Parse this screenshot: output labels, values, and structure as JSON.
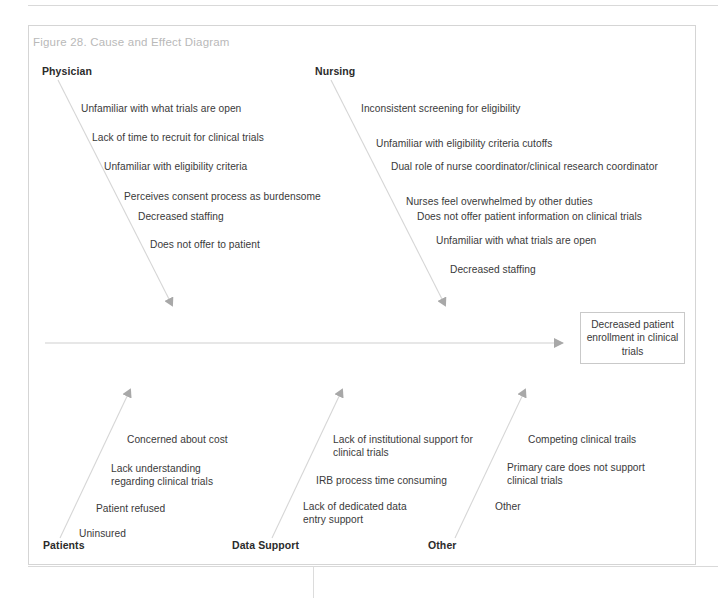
{
  "figure": {
    "title": "Figure 28. Cause and Effect Diagram",
    "type": "fishbone-cause-and-effect-diagram"
  },
  "effect": {
    "text": "Decreased patient enrollment in clinical trials"
  },
  "branches": {
    "physician": {
      "label": "Physician",
      "causes": [
        "Unfamiliar with what trials are open",
        "Lack of time to recruit for clinical trials",
        "Unfamiliar with eligibility criteria",
        "Perceives consent process as burdensome",
        "Decreased staffing",
        "Does not offer to patient"
      ]
    },
    "nursing": {
      "label": "Nursing",
      "causes": [
        "Inconsistent screening for eligibility",
        "Unfamiliar with eligibility criteria cutoffs",
        "Dual role of nurse coordinator/clinical research coordinator",
        "Nurses feel overwhelmed by other duties",
        "Does not offer patient information on clinical trials",
        "Unfamiliar with what trials are open",
        "Decreased staffing"
      ]
    },
    "patients": {
      "label": "Patients",
      "causes": [
        "Concerned about cost",
        "Lack understanding regarding clinical trials",
        "Patient refused",
        "Uninsured"
      ]
    },
    "data_support": {
      "label": "Data Support",
      "causes": [
        "Lack of institutional support for clinical trials",
        "IRB process time consuming",
        "Lack of dedicated data entry support"
      ]
    },
    "other": {
      "label": "Other",
      "causes": [
        "Competing clinical trails",
        "Primary care does not support clinical trials",
        "Other"
      ]
    }
  },
  "colors": {
    "line": "#d2d2d2",
    "arrow": "#a0a0a0",
    "text": "#3a3a3a",
    "label": "#2b2b2b",
    "title": "#b9b9b9",
    "border": "#d5d5d5"
  }
}
